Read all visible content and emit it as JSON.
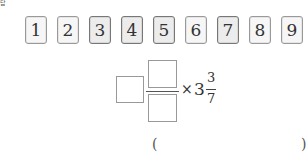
{
  "corner_label": "답",
  "cards": [
    {
      "label": "1",
      "shade": "light"
    },
    {
      "label": "2",
      "shade": "light"
    },
    {
      "label": "3",
      "shade": "dark"
    },
    {
      "label": "4",
      "shade": "dark"
    },
    {
      "label": "5",
      "shade": "dark"
    },
    {
      "label": "6",
      "shade": "light"
    },
    {
      "label": "7",
      "shade": "dark"
    },
    {
      "label": "8",
      "shade": "light"
    },
    {
      "label": "9",
      "shade": "light"
    }
  ],
  "expression": {
    "times_symbol": "×",
    "mixed_whole": "3",
    "mixed_numerator": "3",
    "mixed_denominator": "7"
  },
  "answer": {
    "open_paren": "(",
    "close_paren": ")",
    "value": ""
  }
}
